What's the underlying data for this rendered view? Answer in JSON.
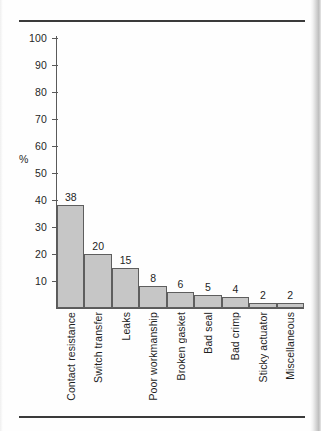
{
  "chart_data": {
    "type": "bar",
    "title": "",
    "xlabel": "",
    "ylabel": "%",
    "ylim": [
      0,
      100
    ],
    "ytick_step": 10,
    "yticks": [
      100,
      90,
      80,
      70,
      60,
      50,
      40,
      30,
      20,
      10
    ],
    "ytick_labels": [
      "100",
      "90",
      "80",
      "70",
      "60",
      "50",
      "40",
      "30",
      "20",
      "10"
    ],
    "grid": false,
    "legend": null,
    "bar_fill_color": "#c6c6c6",
    "bar_edge_color": "#5e5e5e",
    "axis_color": "#5a5a5a",
    "rule_color": "#3a3a3a",
    "categories": [
      "Contact  resistance",
      "Switch transfer",
      "Leaks",
      "Poor workmanship",
      "Broken gasket",
      "Bad seal",
      "Bad crimp",
      "Sticky actuator",
      "Miscellaneous"
    ],
    "values": [
      38,
      20,
      15,
      8,
      6,
      5,
      4,
      2,
      2
    ],
    "value_labels": [
      "38",
      "20",
      "15",
      "8",
      "6",
      "5",
      "4",
      "2",
      "2"
    ]
  }
}
